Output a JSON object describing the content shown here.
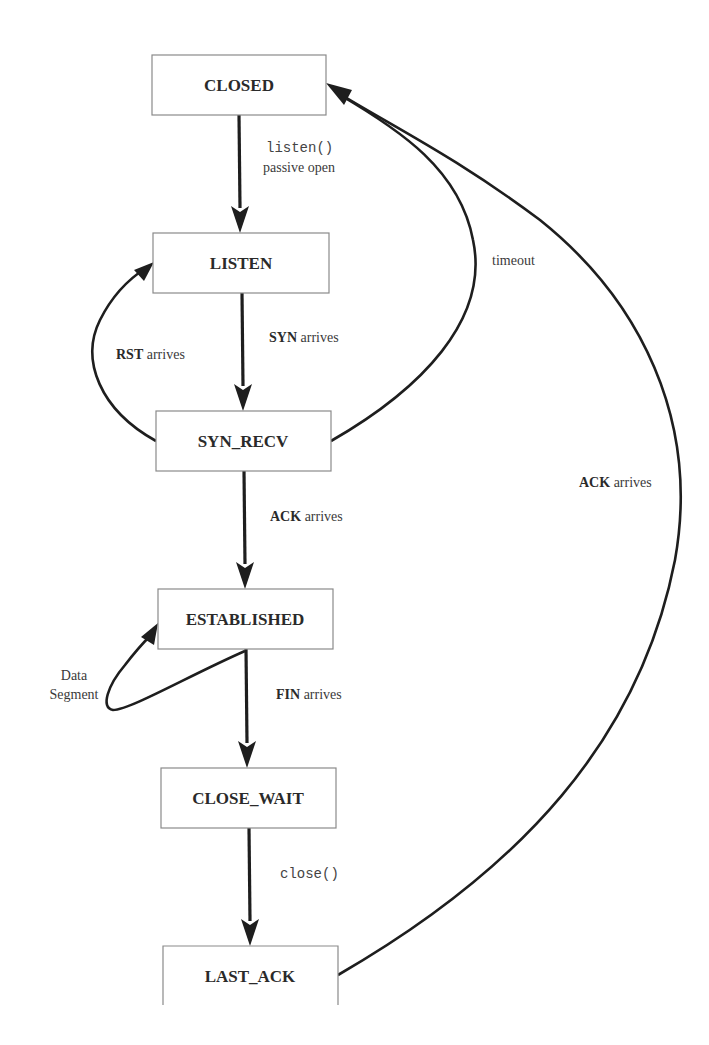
{
  "diagram": {
    "states": [
      {
        "id": "closed",
        "label": "CLOSED"
      },
      {
        "id": "listen",
        "label": "LISTEN"
      },
      {
        "id": "syn_recv",
        "label": "SYN_RECV"
      },
      {
        "id": "established",
        "label": "ESTABLISHED"
      },
      {
        "id": "close_wait",
        "label": "CLOSE_WAIT"
      },
      {
        "id": "last_ack",
        "label": "LAST_ACK"
      }
    ],
    "transitions": {
      "closed_to_listen": {
        "line1": "listen()",
        "line2": "passive open"
      },
      "listen_to_syn_recv": {
        "keyword": "SYN",
        "text": " arrives"
      },
      "syn_recv_to_listen": {
        "keyword": "RST",
        "text": " arrives"
      },
      "syn_recv_to_closed": {
        "text": "timeout"
      },
      "syn_recv_to_established": {
        "keyword": "ACK",
        "text": " arrives"
      },
      "established_self": {
        "line1": "Data",
        "line2": "Segment"
      },
      "established_to_close_wait": {
        "keyword": "FIN",
        "text": " arrives"
      },
      "close_wait_to_last_ack": {
        "text": "close()"
      },
      "last_ack_to_closed": {
        "keyword": "ACK",
        "text": " arrives"
      }
    },
    "colors": {
      "line": "#1e1e1e",
      "box_border": "#8a8a8a",
      "text": "#2a2a2a",
      "background": "#ffffff"
    }
  }
}
